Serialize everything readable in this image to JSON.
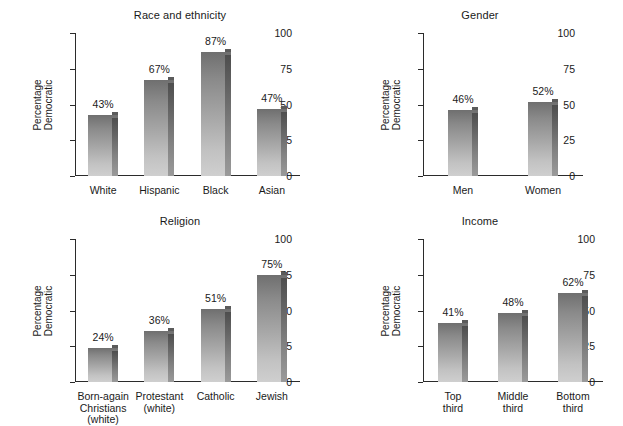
{
  "figure": {
    "value_suffix": "%",
    "axis_color": "#2b2b2b",
    "bar_color_top": "#6f6f6f",
    "bar_color_bottom": "#cfcfcf",
    "background": "#ffffff"
  },
  "chart_data": [
    {
      "id": "race",
      "type": "bar",
      "title": "Race and ethnicity",
      "xlabel": "",
      "ylabel": "Percentage\nDemocratic",
      "ylim": [
        0,
        100
      ],
      "yticks": [
        0,
        25,
        50,
        75,
        100
      ],
      "ytick_labels": [
        "0",
        "25",
        "50",
        "75",
        "100"
      ],
      "grid": false,
      "legend": "none",
      "categories": [
        "White",
        "Hispanic",
        "Black",
        "Asian"
      ],
      "values": [
        43,
        67,
        87,
        47
      ],
      "value_labels": [
        "43%",
        "67%",
        "87%",
        "47%"
      ]
    },
    {
      "id": "gender",
      "type": "bar",
      "title": "Gender",
      "xlabel": "",
      "ylabel": "Percentage\nDemocratic",
      "ylim": [
        0,
        100
      ],
      "yticks": [
        0,
        25,
        50,
        75,
        100
      ],
      "ytick_labels": [
        "0",
        "25",
        "50",
        "75",
        "100"
      ],
      "grid": false,
      "legend": "none",
      "categories": [
        "Men",
        "Women"
      ],
      "values": [
        46,
        52
      ],
      "value_labels": [
        "46%",
        "52%"
      ]
    },
    {
      "id": "religion",
      "type": "bar",
      "title": "Religion",
      "xlabel": "",
      "ylabel": "Percentage\nDemocratic",
      "ylim": [
        0,
        100
      ],
      "yticks": [
        0,
        25,
        50,
        75,
        100
      ],
      "ytick_labels": [
        "0",
        "25",
        "50",
        "75",
        "100"
      ],
      "grid": false,
      "legend": "none",
      "categories": [
        "Born-again\nChristians\n(white)",
        "Protestant\n(white)",
        "Catholic",
        "Jewish"
      ],
      "values": [
        24,
        36,
        51,
        75
      ],
      "value_labels": [
        "24%",
        "36%",
        "51%",
        "75%"
      ]
    },
    {
      "id": "income",
      "type": "bar",
      "title": "Income",
      "xlabel": "",
      "ylabel": "Percentage\nDemocratic",
      "ylim": [
        0,
        100
      ],
      "yticks": [
        0,
        25,
        50,
        75,
        100
      ],
      "ytick_labels": [
        "0",
        "25",
        "50",
        "75",
        "100"
      ],
      "grid": false,
      "legend": "none",
      "categories": [
        "Top\nthird",
        "Middle\nthird",
        "Bottom\nthird"
      ],
      "values": [
        41,
        48,
        62
      ],
      "value_labels": [
        "41%",
        "48%",
        "62%"
      ]
    }
  ]
}
